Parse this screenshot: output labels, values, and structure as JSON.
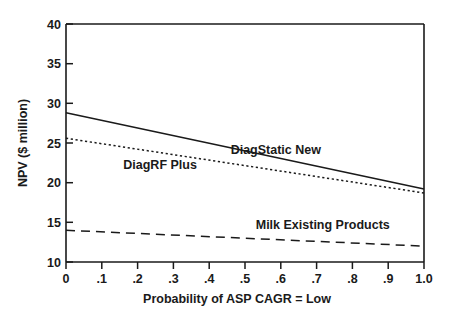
{
  "chart_data": {
    "type": "line",
    "title": "",
    "xlabel": "Probability of ASP CAGR = Low",
    "ylabel": "NPV ($ million)",
    "xlim": [
      0,
      1.0
    ],
    "ylim": [
      10,
      40
    ],
    "grid": false,
    "legend_position": "inline-annotations",
    "x_ticks": [
      0,
      0.1,
      0.2,
      0.3,
      0.4,
      0.5,
      0.6,
      0.7,
      0.8,
      0.9,
      1.0
    ],
    "x_tick_labels": [
      "0",
      ".1",
      ".2",
      ".3",
      ".4",
      ".5",
      ".6",
      ".7",
      ".8",
      ".9",
      "1.0"
    ],
    "y_ticks": [
      10,
      15,
      20,
      25,
      30,
      35,
      40
    ],
    "y_tick_labels": [
      "10",
      "15",
      "20",
      "25",
      "30",
      "35",
      "40"
    ],
    "x": [
      0,
      1.0
    ],
    "series": [
      {
        "name": "DiagStatic New",
        "style": "solid",
        "values": [
          28.8,
          19.2
        ],
        "label_x": 0.46,
        "label_y": 23.6
      },
      {
        "name": "DiagRF Plus",
        "style": "dotted",
        "values": [
          25.6,
          18.7
        ],
        "label_x": 0.16,
        "label_y": 21.7
      },
      {
        "name": "Milk Existing Products",
        "style": "dashed",
        "values": [
          14.0,
          12.0
        ],
        "label_x": 0.53,
        "label_y": 14.1
      }
    ]
  },
  "axes": {
    "y_axis_title": "NPV ($ million)",
    "x_axis_title": "Probability of ASP CAGR = Low"
  },
  "labels": {
    "series_1": "DiagStatic New",
    "series_2": "DiagRF Plus",
    "series_3": "Milk Existing Products"
  },
  "y_tick_0": "10",
  "y_tick_1": "15",
  "y_tick_2": "20",
  "y_tick_3": "25",
  "y_tick_4": "30",
  "y_tick_5": "35",
  "y_tick_6": "40",
  "x_tick_0": "0",
  "x_tick_1": ".1",
  "x_tick_2": ".2",
  "x_tick_3": ".3",
  "x_tick_4": ".4",
  "x_tick_5": ".5",
  "x_tick_6": ".6",
  "x_tick_7": ".7",
  "x_tick_8": ".8",
  "x_tick_9": ".9",
  "x_tick_10": "1.0"
}
